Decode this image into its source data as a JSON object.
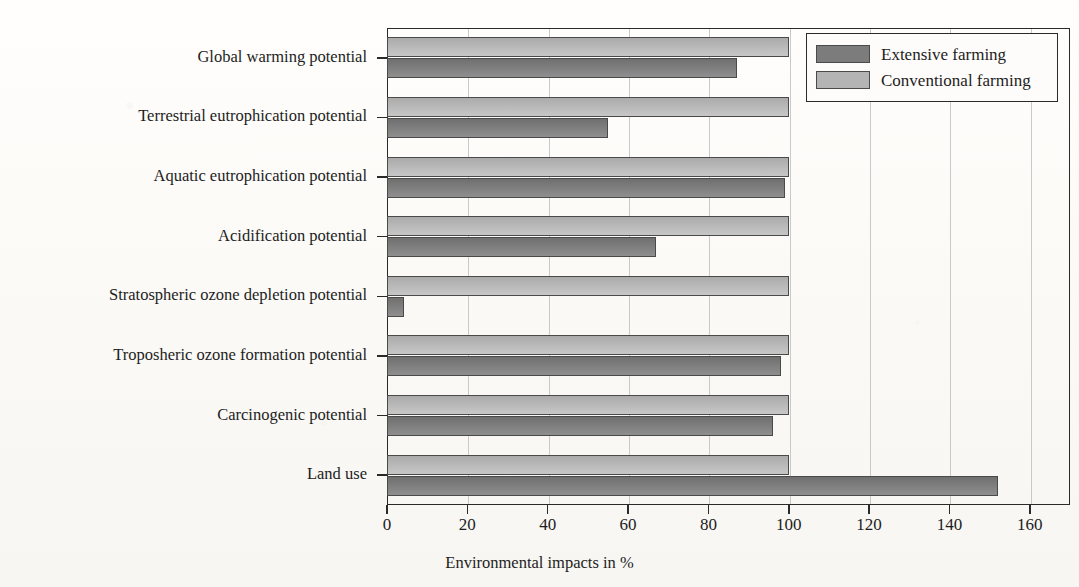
{
  "chart_data": {
    "type": "bar",
    "orientation": "horizontal",
    "title": "",
    "xlabel": "Environmental impacts in %",
    "ylabel": "",
    "xlim": [
      0,
      170
    ],
    "xticks": [
      0,
      20,
      40,
      60,
      80,
      100,
      120,
      140,
      160
    ],
    "xticklabels": [
      "0",
      "20",
      "40",
      "60",
      "80",
      "100",
      "120",
      "140",
      "160"
    ],
    "grid": "vertical",
    "legend_position": "top-right",
    "categories": [
      "Global warming potential",
      "Terrestrial eutrophication potential",
      "Aquatic eutrophication potential",
      "Acidification potential",
      "Stratospheric ozone depletion potential",
      "Troposheric ozone formation potential",
      "Carcinogenic potential",
      "Land use"
    ],
    "series": [
      {
        "name": "Extensive farming",
        "color": "#7c7c7c",
        "values": [
          87,
          55,
          99,
          67,
          4.3,
          98,
          96,
          152
        ]
      },
      {
        "name": "Conventional farming",
        "color": "#b4b4b4",
        "values": [
          100,
          100,
          100,
          100,
          100,
          100,
          100,
          100
        ]
      }
    ]
  },
  "legend": {
    "items": [
      {
        "label": "Extensive farming",
        "swatch": "dark"
      },
      {
        "label": "Conventional farming",
        "swatch": "light"
      }
    ]
  }
}
